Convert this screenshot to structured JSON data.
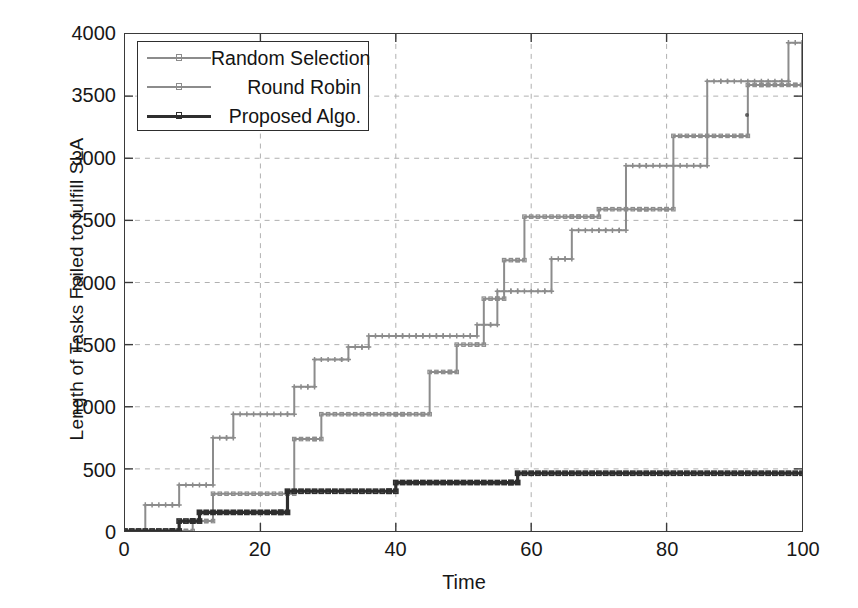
{
  "chart_data": {
    "type": "line",
    "title": "",
    "xlabel": "Time",
    "ylabel": "Length of Tasks Failed to fulfill SLA",
    "xlim": [
      0,
      100
    ],
    "ylim": [
      0,
      4000
    ],
    "xticks": [
      0,
      20,
      40,
      60,
      80,
      100
    ],
    "yticks": [
      0,
      500,
      1000,
      1500,
      2000,
      2500,
      3000,
      3500,
      4000
    ],
    "grid": true,
    "legend_position": "top-left",
    "style": "step",
    "series": [
      {
        "name": "Random Selection",
        "color": "#8c8c8c",
        "marker": "plus",
        "x": [
          0,
          2,
          3,
          7,
          8,
          12,
          13,
          15,
          16,
          24,
          25,
          27,
          28,
          32,
          33,
          35,
          36,
          40,
          41,
          43,
          44,
          46,
          47,
          51,
          52,
          54,
          55,
          57,
          58,
          62,
          63,
          65,
          66,
          70,
          71,
          73,
          74,
          76,
          77,
          85,
          86,
          88,
          89,
          97,
          98,
          100
        ],
        "y": [
          0,
          0,
          210,
          210,
          370,
          370,
          750,
          750,
          940,
          940,
          1160,
          1160,
          1380,
          1380,
          1480,
          1480,
          1570,
          1570,
          1570,
          1570,
          1570,
          1570,
          1570,
          1570,
          1660,
          1660,
          1930,
          1930,
          1930,
          1930,
          2190,
          2190,
          2420,
          2420,
          2420,
          2420,
          2940,
          2940,
          2940,
          2940,
          3620,
          3620,
          3620,
          3620,
          3930,
          3930
        ]
      },
      {
        "name": "Round Robin",
        "color": "#8c8c8c",
        "marker": "square",
        "x": [
          0,
          9,
          10,
          12,
          13,
          24,
          25,
          28,
          29,
          40,
          41,
          44,
          45,
          48,
          49,
          52,
          53,
          55,
          56,
          58,
          59,
          66,
          67,
          69,
          70,
          76,
          77,
          80,
          81,
          91,
          92,
          94,
          95,
          99,
          100
        ],
        "y": [
          0,
          0,
          80,
          80,
          300,
          300,
          740,
          740,
          940,
          940,
          940,
          940,
          1280,
          1280,
          1500,
          1500,
          1870,
          1870,
          2180,
          2180,
          2530,
          2530,
          2530,
          2530,
          2590,
          2590,
          2590,
          2590,
          3180,
          3180,
          3590,
          3590,
          3590,
          3590,
          3930
        ]
      },
      {
        "name": "Proposed Algo.",
        "color": "#2e2e2e",
        "marker": "square",
        "x": [
          0,
          7,
          8,
          10,
          11,
          23,
          24,
          39,
          40,
          57,
          58,
          100
        ],
        "y": [
          0,
          0,
          80,
          80,
          150,
          150,
          320,
          320,
          390,
          390,
          465,
          465
        ]
      }
    ]
  },
  "axis": {
    "xlabel": "Time",
    "ylabel": "Length of Tasks Failed to fulfill SLA",
    "xtick_labels": [
      "0",
      "20",
      "40",
      "60",
      "80",
      "100"
    ],
    "ytick_labels": [
      "0",
      "500",
      "1000",
      "1500",
      "2000",
      "2500",
      "3000",
      "3500",
      "4000"
    ]
  },
  "legend": {
    "entries": [
      {
        "label": "Random Selection",
        "color": "#8c8c8c"
      },
      {
        "label": "Round Robin",
        "color": "#8c8c8c"
      },
      {
        "label": "Proposed Algo.",
        "color": "#2e2e2e"
      }
    ]
  },
  "colors": {
    "grid": "#b0b0b0",
    "frame": "#3a3a3a",
    "background": "#ffffff",
    "text": "#171717",
    "light_series": "#8c8c8c",
    "dark_series": "#2e2e2e"
  }
}
